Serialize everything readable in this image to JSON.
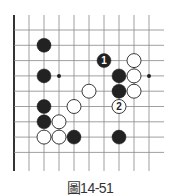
{
  "diagram": {
    "type": "go-board-fragment",
    "columns": 10,
    "rows": 9,
    "open_edges": [
      "top",
      "right",
      "bottom"
    ],
    "board_edge": "left",
    "star_points": [
      [
        3,
        3
      ],
      [
        9,
        3
      ]
    ],
    "stones": [
      {
        "color": "black",
        "col": 2,
        "row": 1,
        "label": ""
      },
      {
        "color": "black",
        "col": 2,
        "row": 3,
        "label": ""
      },
      {
        "color": "black",
        "col": 6,
        "row": 2,
        "label": "1"
      },
      {
        "color": "white",
        "col": 8,
        "row": 2,
        "label": ""
      },
      {
        "color": "black",
        "col": 7,
        "row": 3,
        "label": ""
      },
      {
        "color": "white",
        "col": 8,
        "row": 3,
        "label": ""
      },
      {
        "color": "white",
        "col": 5,
        "row": 4,
        "label": ""
      },
      {
        "color": "black",
        "col": 7,
        "row": 4,
        "label": ""
      },
      {
        "color": "white",
        "col": 8,
        "row": 4,
        "label": ""
      },
      {
        "color": "black",
        "col": 2,
        "row": 5,
        "label": ""
      },
      {
        "color": "white",
        "col": 4,
        "row": 5,
        "label": ""
      },
      {
        "color": "white",
        "col": 7,
        "row": 5,
        "label": "2"
      },
      {
        "color": "black",
        "col": 2,
        "row": 6,
        "label": ""
      },
      {
        "color": "white",
        "col": 3,
        "row": 6,
        "label": ""
      },
      {
        "color": "white",
        "col": 2,
        "row": 7,
        "label": ""
      },
      {
        "color": "white",
        "col": 3,
        "row": 7,
        "label": ""
      },
      {
        "color": "black",
        "col": 4,
        "row": 7,
        "label": ""
      },
      {
        "color": "black",
        "col": 7,
        "row": 7,
        "label": ""
      }
    ],
    "colors": {
      "black_stone": "#222222",
      "white_stone": "#ffffff",
      "grid": "#888888",
      "edge": "#333333"
    }
  },
  "caption": "圖14-51"
}
